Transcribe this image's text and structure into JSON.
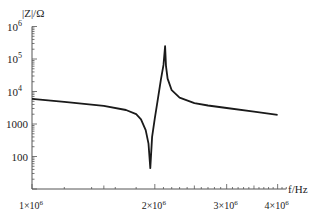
{
  "chart_data": {
    "type": "line",
    "title": "",
    "xlabel": "f/Hz",
    "ylabel": "|Z|/Ω",
    "xscale": "log",
    "yscale": "log",
    "xlim": [
      1000000,
      4200000
    ],
    "ylim": [
      10,
      1000000
    ],
    "grid": false,
    "legend": null,
    "x_ticks": [
      {
        "value": 1000000,
        "label_base": "1×10",
        "label_exp": "6"
      },
      {
        "value": 2000000,
        "label_base": "2×10",
        "label_exp": "6"
      },
      {
        "value": 3000000,
        "label_base": "3×10",
        "label_exp": "6"
      },
      {
        "value": 4000000,
        "label_base": "4×10",
        "label_exp": "6"
      }
    ],
    "y_ticks": [
      {
        "value": 100,
        "label_base": "100",
        "label_exp": ""
      },
      {
        "value": 1000,
        "label_base": "1000",
        "label_exp": ""
      },
      {
        "value": 10000,
        "label_base": "10",
        "label_exp": "4"
      },
      {
        "value": 100000,
        "label_base": "10",
        "label_exp": "5"
      },
      {
        "value": 1000000,
        "label_base": "10",
        "label_exp": "6"
      }
    ],
    "series": [
      {
        "name": "|Z|",
        "color": "#1a1a1a",
        "x": [
          1000000,
          1200000,
          1500000,
          1700000,
          1800000,
          1850000,
          1900000,
          1930000,
          1950000,
          1970000,
          2000000,
          2030000,
          2070000,
          2100000,
          2120000,
          2130000,
          2150000,
          2200000,
          2300000,
          2500000,
          2700000,
          3000000,
          3500000,
          4000000
        ],
        "y": [
          5900,
          4800,
          3600,
          2700,
          2000,
          1400,
          650,
          250,
          44,
          400,
          1500,
          5000,
          23000,
          66000,
          250000,
          60000,
          25000,
          11000,
          6500,
          4400,
          3700,
          3100,
          2400,
          1900
        ]
      }
    ],
    "annotations": []
  }
}
